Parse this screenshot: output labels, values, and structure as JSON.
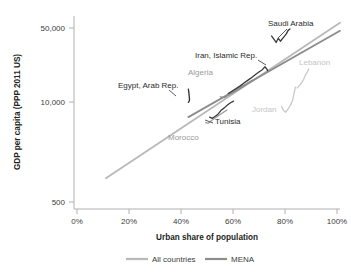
{
  "chart_data": {
    "type": "line",
    "title": "",
    "xlabel": "Urban share of population",
    "ylabel": "GDP per capita (PPP 2011 US)",
    "yscale": "log",
    "ylim": [
      500,
      70000
    ],
    "xlim": [
      0,
      100
    ],
    "grid": false,
    "legend_position": "bottom",
    "x_ticks": [
      "0%",
      "20%",
      "40%",
      "60%",
      "80%",
      "100%"
    ],
    "x_tick_values": [
      0,
      20,
      40,
      60,
      80,
      100
    ],
    "y_ticks": [
      "500",
      "10,000",
      "50,000"
    ],
    "y_tick_values": [
      500,
      10000,
      50000
    ],
    "legend": [
      {
        "name": "All countries",
        "color": "#b9b9b9"
      },
      {
        "name": "MENA",
        "color": "#7a7a7a"
      }
    ],
    "trendlines": [
      {
        "name": "All countries",
        "color": "#b9b9b9",
        "x": [
          12,
          100
        ],
        "y": [
          1900,
          56000
        ]
      },
      {
        "name": "MENA",
        "color": "#8c8c8c",
        "x": [
          43,
          100
        ],
        "y": [
          7200,
          47000
        ]
      }
    ],
    "series": [
      {
        "name": "Saudi Arabia",
        "color": "#3a3a3a",
        "label_color": "dark",
        "label_x": 268,
        "label_y": 26,
        "x": [
          74.3,
          75.2,
          76.0,
          76.8,
          77.6,
          78.3,
          79.0,
          79.8,
          80.5,
          81.2
        ],
        "y": [
          42000,
          39000,
          36500,
          40000,
          37500,
          39500,
          41500,
          44000,
          47500,
          49000
        ]
      },
      {
        "name": "Iran, Islamic Rep.",
        "color": "#3a3a3a",
        "label_color": "dark",
        "label_x": 195,
        "label_y": 58,
        "x": [
          58.0,
          60.5,
          62.5,
          64.5,
          66.5,
          68.0,
          69.5,
          70.8,
          71.8,
          72.5,
          72.8
        ],
        "y": [
          12000,
          13200,
          14200,
          15500,
          16800,
          18000,
          19200,
          20200,
          21500,
          20500,
          19800
        ]
      },
      {
        "name": "Algeria",
        "color": "#8c8c8c",
        "label_color": "gray",
        "label_x": 188,
        "label_y": 75,
        "x": [
          55.0,
          56.5,
          58.0,
          59.5,
          61.0,
          62.5,
          64.0,
          65.5,
          67.0
        ],
        "y": [
          11200,
          11000,
          11600,
          12200,
          12800,
          13400,
          14200,
          15200,
          16000
        ]
      },
      {
        "name": "Egypt, Arab Rep.",
        "color": "#2b2b2b",
        "label_color": "dark",
        "label_x": 118,
        "label_y": 88,
        "x": [
          43.0,
          43.2,
          43.3,
          43.4,
          43.4,
          43.3,
          43.2,
          43.1,
          43.0
        ],
        "y": [
          13200,
          12200,
          11400,
          10800,
          10400,
          10200,
          10100,
          10000,
          9950
        ]
      },
      {
        "name": "Tunisia",
        "color": "#3a3a3a",
        "label_color": "dark",
        "label_x": 215,
        "label_y": 124,
        "x": [
          51.0,
          52.0,
          53.0,
          54.0,
          55.2,
          56.5,
          57.8,
          59.0,
          60.0
        ],
        "y": [
          7200,
          7000,
          7300,
          7600,
          8300,
          8800,
          9400,
          9900,
          10200
        ]
      },
      {
        "name": "Morocco",
        "color": "#9a9a9a",
        "label_color": "gray",
        "label_x": 168,
        "label_y": 140,
        "x": [
          49.5,
          50.5,
          51.5,
          52.5,
          53.5,
          54.5,
          55.5,
          56.5,
          57.5
        ],
        "y": [
          6400,
          6300,
          6600,
          6900,
          7200,
          7500,
          7800,
          8100,
          8400
        ]
      },
      {
        "name": "Jordan",
        "color": "#c9c9c9",
        "label_color": "light",
        "label_x": 252,
        "label_y": 112,
        "x": [
          78.0,
          78.8,
          79.5,
          80.2,
          80.9,
          81.6,
          82.2,
          82.8,
          83.2,
          83.4
        ],
        "y": [
          9100,
          8300,
          8000,
          8400,
          8900,
          9600,
          10400,
          12400,
          13800,
          13600
        ]
      },
      {
        "name": "Lebanon",
        "color": "#c9c9c9",
        "label_color": "light",
        "label_x": 299,
        "label_y": 65,
        "x": [
          84.0,
          84.6,
          85.2,
          85.8,
          86.4,
          86.9,
          87.4,
          87.8,
          88.1,
          88.3
        ],
        "y": [
          13600,
          14200,
          14800,
          15500,
          16500,
          17800,
          18600,
          19400,
          20200,
          20500
        ]
      }
    ],
    "leader_lines": [
      {
        "name": "saudi-arabia-leader",
        "x1": 287,
        "y1": 29,
        "x2": 278,
        "y2": 38
      },
      {
        "name": "iran-leader",
        "x1": 258,
        "y1": 60,
        "x2": 266,
        "y2": 65
      },
      {
        "name": "egypt-leader",
        "x1": 169,
        "y1": 90,
        "x2": 176,
        "y2": 96
      },
      {
        "name": "tunisia-leader",
        "x1": 213,
        "y1": 123,
        "x2": 205,
        "y2": 120
      }
    ]
  },
  "annotations": {
    "saudi_arabia": "Saudi Arabia",
    "iran": "Iran, Islamic Rep.",
    "algeria": "Algeria",
    "egypt": "Egypt, Arab Rep.",
    "tunisia": "Tunisia",
    "morocco": "Morocco",
    "jordan": "Jordan",
    "lebanon": "Lebanon"
  },
  "axes": {
    "y_title": "GDP per capita (PPP 2011 US)",
    "x_title": "Urban share of population",
    "y_tick_top": "50,000",
    "y_tick_mid": "10,000",
    "y_tick_bottom": "500",
    "x_tick_0": "0%",
    "x_tick_1": "20%",
    "x_tick_2": "40%",
    "x_tick_3": "60%",
    "x_tick_4": "80%",
    "x_tick_5": "100%"
  },
  "legend": {
    "item_all_countries": "All countries",
    "item_mena": "MENA"
  },
  "colors": {
    "all_countries": "#b9b9b9",
    "mena": "#8c8c8c",
    "axis": "#b0b0b0",
    "text": "#231f20"
  }
}
